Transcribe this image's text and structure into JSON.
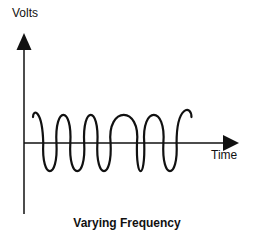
{
  "chart_data": {
    "type": "line",
    "title": "Varying Frequency",
    "xlabel": "Time",
    "ylabel": "Volts",
    "grid": false,
    "series": [
      {
        "name": "signal",
        "color": "#111111",
        "segments": [
          {
            "type": "start",
            "x": 0.6,
            "y": 0.55
          },
          {
            "type": "half-cycle",
            "width": 0.55,
            "sign": 1
          },
          {
            "type": "half-cycle",
            "width": 1.0,
            "sign": -1
          },
          {
            "type": "half-cycle",
            "width": 1.05,
            "sign": 1
          },
          {
            "type": "half-cycle",
            "width": 1.05,
            "sign": -1
          },
          {
            "type": "half-cycle",
            "width": 1.0,
            "sign": 1
          },
          {
            "type": "half-cycle",
            "width": 1.0,
            "sign": -1
          },
          {
            "type": "half-cycle",
            "width": 2.0,
            "sign": 1
          },
          {
            "type": "half-cycle",
            "width": 0.55,
            "sign": -1
          },
          {
            "type": "half-cycle",
            "width": 1.45,
            "sign": 1
          },
          {
            "type": "half-cycle",
            "width": 1.0,
            "sign": -1
          },
          {
            "type": "half-cycle",
            "width": 0.9,
            "sign": 1
          }
        ]
      }
    ],
    "xlim": [
      0,
      12
    ],
    "ylim": [
      -1.9,
      2.3
    ]
  }
}
